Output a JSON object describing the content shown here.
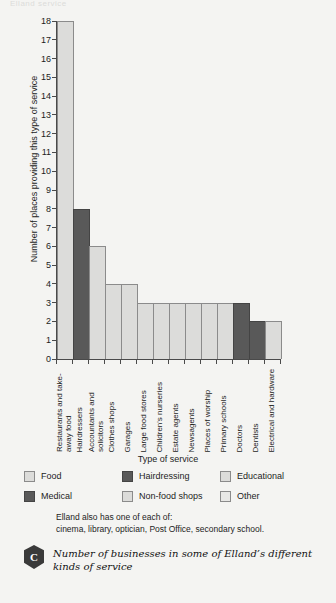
{
  "top_sliver_text": "Elland service",
  "chart_data": {
    "type": "bar",
    "title": "",
    "xlabel": "Type of service",
    "ylabel": "Number of places providing this type of service",
    "ylim": [
      0,
      18
    ],
    "ytick_step": 1,
    "yticks": [
      "18",
      "17",
      "16",
      "15",
      "14",
      "13",
      "12",
      "11",
      "10",
      "9",
      "8",
      "7",
      "6",
      "5",
      "4",
      "3",
      "2",
      "1",
      "0"
    ],
    "grid": false,
    "legend_position": "below-axis",
    "categories": [
      "Restaurants and take-away food",
      "Hairdressers",
      "Accountants and solicitors",
      "Clothes shops",
      "Garages",
      "Large food stores",
      "Children's nurseries",
      "Estate agents",
      "Newsagents",
      "Places of worship",
      "Primary schools",
      "Doctors",
      "Dentists",
      "Electrical and hardware"
    ],
    "values": [
      18,
      8,
      6,
      4,
      4,
      3,
      3,
      3,
      3,
      3,
      3,
      3,
      2,
      2
    ],
    "bar_shades": [
      "light",
      "dark",
      "light",
      "light",
      "light",
      "light",
      "light",
      "light",
      "light",
      "light",
      "light",
      "dark",
      "dark",
      "light"
    ],
    "colors": {
      "light": "#dcdcda",
      "dark": "#595959",
      "axis": "#4a4a4a",
      "background": "#f4f4f2"
    }
  },
  "legend": {
    "items": [
      {
        "label": "Food",
        "shade": "light"
      },
      {
        "label": "Hairdressing",
        "shade": "dark"
      },
      {
        "label": "Educational",
        "shade": "light"
      },
      {
        "label": "Medical",
        "shade": "dark"
      },
      {
        "label": "Non-food shops",
        "shade": "light"
      },
      {
        "label": "Other",
        "shade": "pale"
      }
    ]
  },
  "note": {
    "line1": "Elland also has one of each of:",
    "line2": "cinema, library, optician, Post Office, secondary school."
  },
  "caption": {
    "badge": "C",
    "text": "Number of businesses in some of Elland’s different kinds of service"
  }
}
